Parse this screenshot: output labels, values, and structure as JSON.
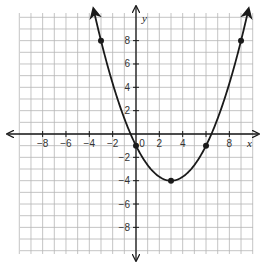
{
  "chart_data": {
    "type": "line",
    "title": "",
    "xlabel": "x",
    "ylabel": "y",
    "xlim": [
      -10,
      10
    ],
    "ylim": [
      -10,
      10
    ],
    "grid": true,
    "grid_step": 1,
    "x_ticks": [
      -8,
      -6,
      -4,
      -2,
      0,
      2,
      4,
      6,
      8
    ],
    "x_tick_labels": [
      "−8",
      "−6",
      "−4",
      "−2",
      "0",
      "2",
      "4",
      "",
      "8"
    ],
    "y_ticks": [
      -8,
      -6,
      -4,
      -2,
      2,
      4,
      6,
      8
    ],
    "y_tick_labels": [
      "−8",
      "−6",
      "−4",
      "−2",
      "2",
      "4",
      "6",
      "8"
    ],
    "series": [
      {
        "name": "parabola",
        "equation": "y = (1/3)(x - 3)^2 - 4",
        "vertex": [
          3,
          -4
        ],
        "domain_drawn": [
          -3.6,
          9.6
        ],
        "arrows_at_ends": true,
        "color": "#1a1a1a"
      }
    ],
    "points": [
      {
        "x": -3,
        "y": 8
      },
      {
        "x": 0,
        "y": -1
      },
      {
        "x": 3,
        "y": -4
      },
      {
        "x": 6,
        "y": -1
      },
      {
        "x": 9,
        "y": 8
      }
    ]
  },
  "colors": {
    "grid": "#b5b5b5",
    "axis": "#1a1a1a",
    "curve": "#1a1a1a",
    "background": "#ffffff"
  },
  "layout": {
    "origin_px": [
      136,
      134
    ],
    "unit_px": 11.67,
    "grid_left": 20,
    "grid_top": 13,
    "grid_right": 253,
    "grid_bottom": 254
  }
}
